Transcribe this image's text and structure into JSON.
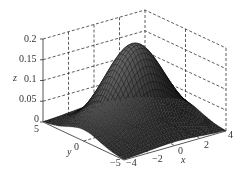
{
  "chart_data": {
    "type": "surface3d",
    "title": "",
    "function": "z = 0.2 * exp(-(x^2 + y^2)/8) (Gaussian bell surface)",
    "xlabel": "x",
    "ylabel": "y",
    "zlabel": "z",
    "xlim": [
      -4,
      4
    ],
    "ylim": [
      -5,
      5
    ],
    "zlim": [
      0,
      0.2
    ],
    "x_ticks": [
      "-4",
      "-2",
      "0",
      "2",
      "4"
    ],
    "y_ticks": [
      "-5",
      "0",
      "5"
    ],
    "z_ticks": [
      "0",
      "0.05",
      "0.1",
      "0.15",
      "0.2"
    ],
    "peak": {
      "x": 0,
      "y": 0,
      "z": 0.2
    },
    "grid": true,
    "grid_style": "dashed",
    "colormap": "grayscale"
  },
  "labels": {
    "z_axis": "z",
    "y_axis": "y",
    "x_axis": "x",
    "z_ticks": [
      {
        "text": "0.2",
        "x": 24,
        "y": 34
      },
      {
        "text": "0.15",
        "x": 19,
        "y": 54
      },
      {
        "text": "0.1",
        "x": 24,
        "y": 74
      },
      {
        "text": "0.05",
        "x": 19,
        "y": 94
      },
      {
        "text": "0",
        "x": 34,
        "y": 114
      }
    ],
    "y_ticks": [
      {
        "text": "5",
        "x": 34,
        "y": 124
      },
      {
        "text": "0",
        "x": 74,
        "y": 142
      },
      {
        "text": "−5",
        "x": 110,
        "y": 158
      }
    ],
    "x_ticks": [
      {
        "text": "−4",
        "x": 126,
        "y": 158
      },
      {
        "text": "−2",
        "x": 152,
        "y": 154
      },
      {
        "text": "0",
        "x": 178,
        "y": 146
      },
      {
        "text": "2",
        "x": 204,
        "y": 140
      },
      {
        "text": "4",
        "x": 228,
        "y": 130
      }
    ]
  }
}
